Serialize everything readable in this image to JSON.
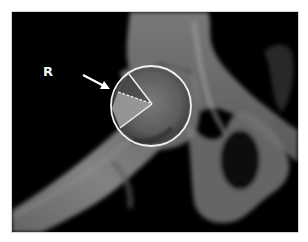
{
  "image": {
    "type": "pelvic radiograph (hip joint, AP view)",
    "side_marker": "R",
    "annotations": {
      "arrow": {
        "direction": "down-right",
        "points_to": "femoral head lateral edge",
        "color": "#ffffff"
      },
      "circle": {
        "label": "femoral head outline",
        "cx": 139,
        "cy": 94,
        "r": 40,
        "stroke": "#f0f0f0"
      },
      "angle": {
        "vertex": [
          140,
          92
        ],
        "upper_ray_end": [
          117,
          62
        ],
        "lower_ray_end": [
          108,
          116
        ],
        "dashed_ray_start": [
          106,
          80
        ],
        "shaded_region_fill": "#9a9a9a"
      }
    },
    "colors": {
      "background": "#000000",
      "bone": "#8c8c8c",
      "bone_bright": "#b0b0b0",
      "annotation": "#f0f0f0",
      "page": "#ffffff"
    }
  }
}
